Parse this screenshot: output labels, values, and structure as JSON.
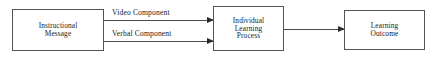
{
  "diagram": {
    "type": "flowchart",
    "orientation": "left-to-right",
    "background_color": "#ffffff",
    "box_border_color": "#555555",
    "arrow_color": "#2b2b2b",
    "text_color": "#1a1a1a",
    "nodes": [
      {
        "id": "instructional-message",
        "label": "Instructional\nMessage",
        "lines": [
          "Instructional",
          "Message"
        ]
      },
      {
        "id": "individual-learning-process",
        "label": "Individual\nLearning\nProcess",
        "lines": [
          "Individual",
          "Learning",
          "Process"
        ]
      },
      {
        "id": "learning-outcome",
        "label": "Learning\nOutcome",
        "lines": [
          "Learning",
          "Outcome"
        ]
      }
    ],
    "edges": [
      {
        "id": "video",
        "label": "Video Component",
        "from": "instructional-message",
        "to": "individual-learning-process"
      },
      {
        "id": "verbal",
        "label": "Verbal Component",
        "from": "instructional-message",
        "to": "individual-learning-process"
      },
      {
        "id": "process-to-outcome",
        "label": "",
        "from": "individual-learning-process",
        "to": "learning-outcome"
      }
    ]
  }
}
